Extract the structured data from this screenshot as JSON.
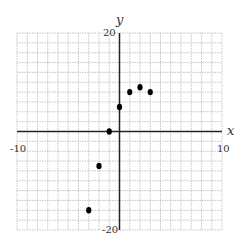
{
  "chart_data": {
    "type": "scatter",
    "title": "",
    "xlabel": "x",
    "ylabel": "y",
    "xlim": [
      -10,
      10
    ],
    "ylim": [
      -20,
      20
    ],
    "grid": true,
    "x_grid_step": 1,
    "y_grid_step": 2,
    "tick_labels": {
      "x_min": "-10",
      "x_max": "10",
      "y_max": "20",
      "y_min": "-20"
    },
    "series": [
      {
        "name": "points",
        "points": [
          {
            "x": -3,
            "y": -16
          },
          {
            "x": -2,
            "y": -7
          },
          {
            "x": -1,
            "y": 0
          },
          {
            "x": 0,
            "y": 5
          },
          {
            "x": 1,
            "y": 8
          },
          {
            "x": 2,
            "y": 9
          },
          {
            "x": 3,
            "y": 8
          }
        ]
      }
    ]
  },
  "colors": {
    "grid": "#b8b8b8",
    "axis": "#222222",
    "point": "#000000"
  }
}
